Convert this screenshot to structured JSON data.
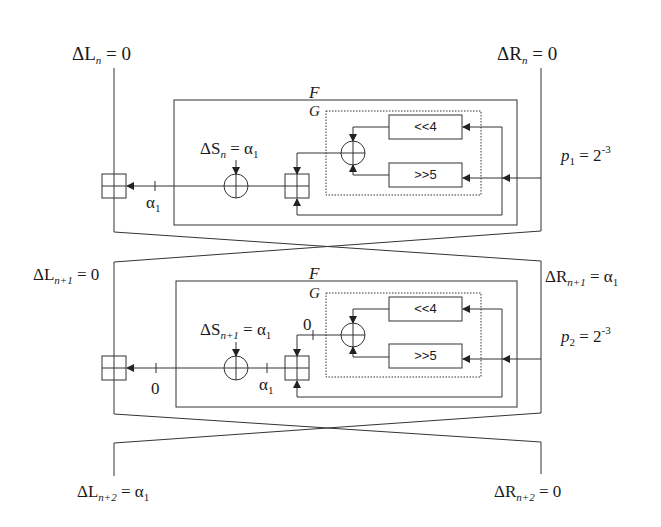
{
  "diagram": {
    "type": "two-round Feistel differential trail",
    "colors": {
      "line": "#333333",
      "background": "#ffffff"
    },
    "rounds": [
      {
        "index": 1,
        "input_left": {
          "symbol": "ΔL",
          "sub": "n",
          "value": "0"
        },
        "input_right": {
          "symbol": "ΔR",
          "sub": "n",
          "value": "0"
        },
        "f_label": "F",
        "g_label": "G",
        "shift_left_label": "<<4",
        "shift_right_label": ">>5",
        "delta_s": {
          "symbol": "ΔS",
          "sub": "n",
          "value": "α",
          "value_sub": "1"
        },
        "wire_left_label": {
          "value": "α",
          "sub": "1"
        },
        "probability": {
          "symbol": "p",
          "sub": "1",
          "base": "2",
          "exp": "-3"
        }
      },
      {
        "index": 2,
        "input_left": {
          "symbol": "ΔL",
          "sub": "n+1",
          "value": "0"
        },
        "input_right": {
          "symbol": "ΔR",
          "sub": "n+1",
          "value": "α",
          "value_sub": "1"
        },
        "f_label": "F",
        "g_label": "G",
        "shift_left_label": "<<4",
        "shift_right_label": ">>5",
        "delta_s": {
          "symbol": "ΔS",
          "sub": "n+1",
          "value": "α",
          "value_sub": "1"
        },
        "g_output_label": "0",
        "wire_mid_label": {
          "value": "α",
          "sub": "1"
        },
        "wire_left_label": "0",
        "probability": {
          "symbol": "p",
          "sub": "2",
          "base": "2",
          "exp": "-3"
        }
      }
    ],
    "output_left": {
      "symbol": "ΔL",
      "sub": "n+2",
      "value": "α",
      "value_sub": "1"
    },
    "output_right": {
      "symbol": "ΔR",
      "sub": "n+2",
      "value": "0"
    }
  }
}
